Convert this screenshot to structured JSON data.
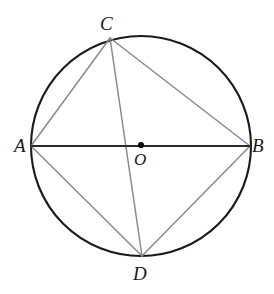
{
  "figure": {
    "type": "geometry-diagram",
    "width": 274,
    "height": 294,
    "background_color": "#ffffff"
  },
  "colors": {
    "circle_stroke": "#1a1a1a",
    "diameter_stroke": "#2a2a2a",
    "chord_stroke": "#8a8a8a",
    "label_text": "#1a1a1a",
    "center_dot": "#111111"
  },
  "circle": {
    "name": "main-circle",
    "center_x": 141,
    "center_y": 146,
    "radius": 110,
    "stroke_width": 2.1
  },
  "center_point": {
    "label": "O",
    "x": 141,
    "y": 145,
    "dot_radius": 3.1
  },
  "points": [
    {
      "label": "A",
      "x": 31,
      "y": 146
    },
    {
      "label": "B",
      "x": 250,
      "y": 146
    },
    {
      "label": "C",
      "x": 110,
      "y": 38
    },
    {
      "label": "D",
      "x": 142,
      "y": 256
    }
  ],
  "segments": [
    {
      "name": "segment-AB",
      "from": "A",
      "to": "B",
      "x1": 31,
      "y1": 146,
      "x2": 250,
      "y2": 146,
      "style": "diameter",
      "stroke": "#2a2a2a",
      "stroke_width": 1.9
    },
    {
      "name": "segment-CD",
      "from": "C",
      "to": "D",
      "x1": 110,
      "y1": 38,
      "x2": 142,
      "y2": 256,
      "style": "chord",
      "stroke": "#8a8a8a",
      "stroke_width": 1.5
    },
    {
      "name": "segment-AC",
      "from": "A",
      "to": "C",
      "x1": 31,
      "y1": 146,
      "x2": 110,
      "y2": 38,
      "style": "chord",
      "stroke": "#8a8a8a",
      "stroke_width": 1.5
    },
    {
      "name": "segment-CB",
      "from": "C",
      "to": "B",
      "x1": 110,
      "y1": 38,
      "x2": 250,
      "y2": 146,
      "style": "chord",
      "stroke": "#8a8a8a",
      "stroke_width": 1.5
    },
    {
      "name": "segment-AD",
      "from": "A",
      "to": "D",
      "x1": 31,
      "y1": 146,
      "x2": 142,
      "y2": 256,
      "style": "chord",
      "stroke": "#8a8a8a",
      "stroke_width": 1.5
    },
    {
      "name": "segment-DB",
      "from": "D",
      "to": "B",
      "x1": 142,
      "y1": 256,
      "x2": 250,
      "y2": 146,
      "style": "chord",
      "stroke": "#8a8a8a",
      "stroke_width": 1.5
    }
  ],
  "labels": {
    "A": "A",
    "B": "B",
    "C": "C",
    "D": "D",
    "O": "O"
  }
}
